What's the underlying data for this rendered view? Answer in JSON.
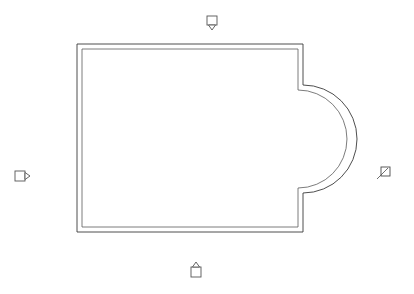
{
  "document": {
    "title": "Floor Plan",
    "background_color": "#ffffff",
    "width": 414,
    "height": 294
  },
  "style": {
    "wall_outer_color": "#3a3a3a",
    "wall_inner_color": "#5a5a5a",
    "marker_stroke_color": "#555555",
    "marker_fill_color": "#ffffff",
    "node_stroke_color": "#4a4a4a"
  },
  "plan": {
    "name": "building-outline",
    "description": "Rectangular plan with semicircular apse on the right side",
    "wall_thickness": 4,
    "outer_outline_path": "M 77 44 L 303 44 L 303 85 A 54 54 0 0 1 303 193 L 303 232 L 77 232 Z",
    "inner_outline_path": "M 82 49 L 298 49 L 298 90 A 49 49 0 0 1 298 188 L 298 227 L 82 227 Z",
    "geometry": {
      "rect_left": 77,
      "rect_top": 44,
      "rect_right": 303,
      "rect_bottom": 232,
      "apse_center_x": 303,
      "apse_center_y": 139,
      "apse_radius_outer": 54,
      "apse_radius_inner": 49,
      "apse_start_y": 85,
      "apse_end_y": 193,
      "apse_rightmost_x": 390
    }
  },
  "markers": [
    {
      "id": "view-marker-top",
      "name": "view-marker-top",
      "label": "",
      "direction": "down",
      "x": 212,
      "y": 22,
      "size": 9
    },
    {
      "id": "view-marker-left",
      "name": "view-marker-left",
      "label": "",
      "direction": "right",
      "x": 22,
      "y": 176,
      "size": 9
    },
    {
      "id": "view-marker-bottom",
      "name": "view-marker-bottom",
      "label": "",
      "direction": "up",
      "x": 196,
      "y": 271,
      "size": 9
    }
  ],
  "nodes": [
    {
      "id": "arc-node-right",
      "name": "arc-control-node",
      "label": "",
      "x": 385,
      "y": 172,
      "size": 8
    }
  ]
}
